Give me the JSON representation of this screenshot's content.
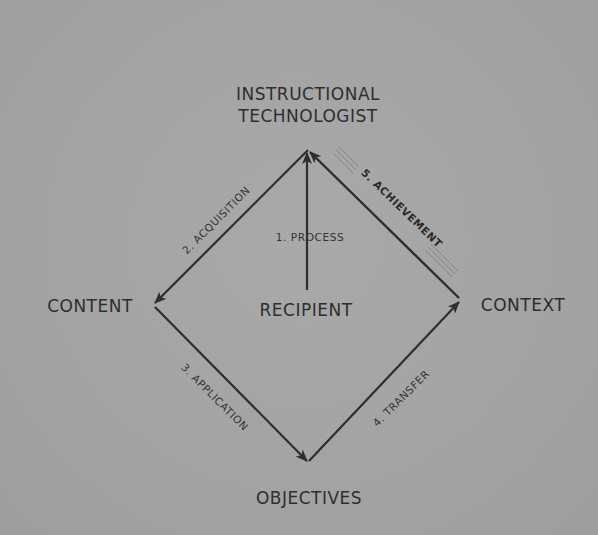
{
  "diagram": {
    "nodes": {
      "top": {
        "line1": "INSTRUCTIONAL",
        "line2": "TECHNOLOGIST"
      },
      "left": "CONTENT",
      "right": "CONTEXT",
      "bottom": "OBJECTIVES",
      "center": "RECIPIENT"
    },
    "edges": [
      {
        "id": "process",
        "label": "1. PROCESS",
        "from": "RECIPIENT",
        "to": "INSTRUCTIONAL TECHNOLOGIST"
      },
      {
        "id": "acquisition",
        "label": "2. ACQUISITION",
        "from": "INSTRUCTIONAL TECHNOLOGIST",
        "to": "CONTENT"
      },
      {
        "id": "application",
        "label": "3. APPLICATION",
        "from": "CONTENT",
        "to": "OBJECTIVES"
      },
      {
        "id": "transfer",
        "label": "4. TRANSFER",
        "from": "OBJECTIVES",
        "to": "CONTEXT"
      },
      {
        "id": "achievement",
        "label": "5. ACHIEVEMENT",
        "from": "CONTEXT",
        "to": "INSTRUCTIONAL TECHNOLOGIST",
        "emphasized": true
      }
    ],
    "colors": {
      "background": "#a4a4a4",
      "line": "#2e2e2e",
      "text": "#2e2e2e"
    }
  }
}
